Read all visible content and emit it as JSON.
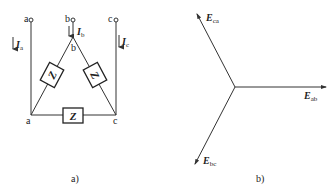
{
  "figure_a": {
    "caption": "a)",
    "terminals": [
      {
        "label": "a",
        "current": "I",
        "current_sub": "a"
      },
      {
        "label": "b",
        "current": "I",
        "current_sub": "b"
      },
      {
        "label": "c",
        "current": "I",
        "current_sub": "c"
      }
    ],
    "nodes": {
      "a": "a",
      "b": "b",
      "c": "c"
    },
    "impedance_label": "Z"
  },
  "figure_b": {
    "caption": "b)",
    "phasors": [
      {
        "symbol": "E",
        "sub": "ca"
      },
      {
        "symbol": "E",
        "sub": "ab"
      },
      {
        "symbol": "E",
        "sub": "bc"
      }
    ]
  },
  "colors": {
    "line": "#333333",
    "text": "#222222",
    "background": "#ffffff"
  }
}
